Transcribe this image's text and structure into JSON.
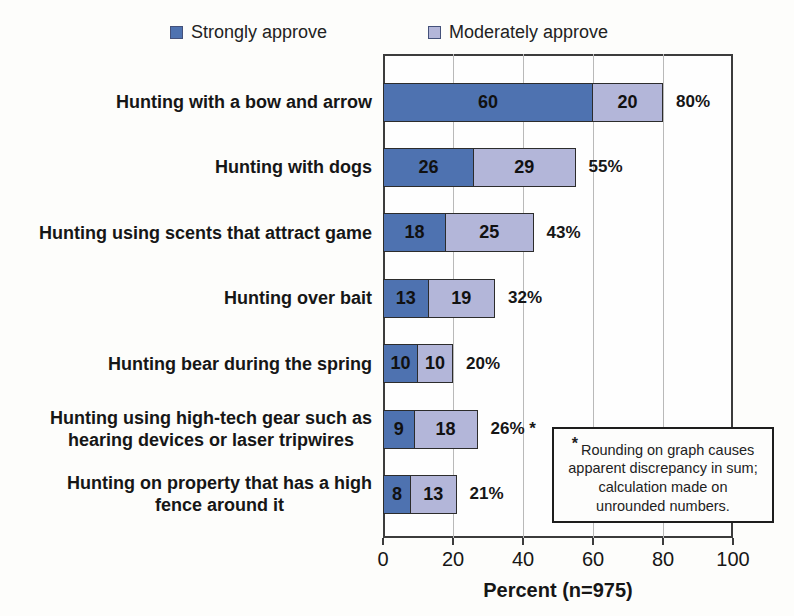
{
  "chart_data": {
    "type": "bar",
    "orientation": "horizontal-stacked",
    "title": "",
    "categories": [
      "Hunting with a bow and arrow",
      "Hunting with dogs",
      "Hunting using scents that attract game",
      "Hunting over bait",
      "Hunting bear during the spring",
      "Hunting using high-tech gear such as\nhearing devices or laser tripwires",
      "Hunting on property that has a high\nfence around it"
    ],
    "series": [
      {
        "name": "Strongly approve",
        "color": "#4e72b0",
        "values": [
          60,
          26,
          18,
          13,
          10,
          9,
          8
        ]
      },
      {
        "name": "Moderately approve",
        "color": "#b3b6d9",
        "values": [
          20,
          29,
          25,
          19,
          10,
          18,
          13
        ]
      }
    ],
    "totals": [
      "80%",
      "55%",
      "43%",
      "32%",
      "20%",
      "26% *",
      "21%"
    ],
    "xlabel": "Percent (n=975)",
    "xticks": [
      0,
      20,
      40,
      60,
      80,
      100
    ],
    "xlim": [
      0,
      100
    ],
    "grid": true,
    "legend_position": "top",
    "annotation": {
      "marker": "*",
      "text": "Rounding on graph causes apparent discrepancy in sum; calculation made on unrounded numbers."
    }
  }
}
